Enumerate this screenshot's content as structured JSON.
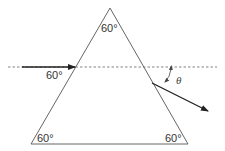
{
  "diagram": {
    "type": "prism-refraction",
    "angles": {
      "apex": "60°",
      "incidence": "60°",
      "base_left": "60°",
      "base_right": "60°"
    },
    "deviation_label": "θ",
    "colors": {
      "lines": "#555555",
      "rays": "#222222",
      "dashed": "#666666"
    }
  }
}
